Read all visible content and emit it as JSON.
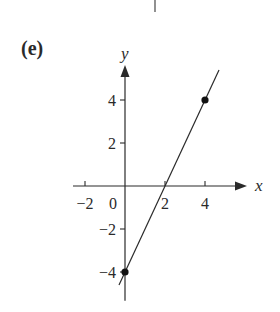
{
  "panel_label": "(e)",
  "chart_data": {
    "type": "line",
    "title": "",
    "xlabel": "x",
    "ylabel": "y",
    "xlim": [
      -2.6,
      5.2
    ],
    "ylim": [
      -5.2,
      5.6
    ],
    "grid": false,
    "legend": null,
    "x_ticks": [
      -2,
      2,
      4
    ],
    "x_tick_labels": [
      "-2",
      "2",
      "4"
    ],
    "origin_label": "0",
    "y_ticks": [
      4,
      2,
      -2,
      -4
    ],
    "y_tick_labels": [
      "4",
      "2",
      "−2",
      "−4"
    ],
    "series": [
      {
        "name": "line",
        "equation": "y = 2x - 4",
        "x": [
          -0.3,
          4.7
        ],
        "y": [
          -4.6,
          5.4
        ]
      }
    ],
    "points": [
      {
        "x": 0,
        "y": -4,
        "style": "filled-dot"
      },
      {
        "x": 4,
        "y": 4,
        "style": "filled-dot"
      }
    ],
    "x_intercept": 2,
    "y_intercept": -4
  },
  "colors": {
    "ink": "#2a2a2a",
    "background": "#ffffff"
  }
}
